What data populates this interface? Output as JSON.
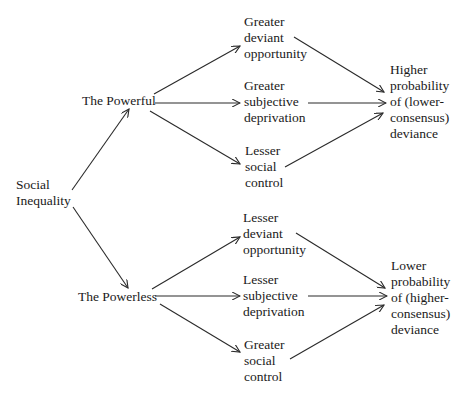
{
  "diagram": {
    "type": "flow-diagram",
    "root": {
      "id": "social_inequality",
      "lines": [
        "Social",
        "Inequality"
      ]
    },
    "groups": [
      {
        "id": "powerful",
        "label": "The Powerful",
        "factors": [
          {
            "id": "p_opportunity",
            "lines": [
              "Greater",
              "deviant",
              "opportunity"
            ]
          },
          {
            "id": "p_deprivation",
            "lines": [
              "Greater",
              "subjective",
              "deprivation"
            ]
          },
          {
            "id": "p_control",
            "lines": [
              "Lesser",
              "social",
              "control"
            ]
          }
        ],
        "outcome": {
          "id": "p_outcome",
          "lines": [
            "Higher",
            "probability",
            "of (lower-",
            "consensus)",
            "deviance"
          ]
        }
      },
      {
        "id": "powerless",
        "label": "The Powerless",
        "factors": [
          {
            "id": "pl_opportunity",
            "lines": [
              "Lesser",
              "deviant",
              "opportunity"
            ]
          },
          {
            "id": "pl_deprivation",
            "lines": [
              "Lesser",
              "subjective",
              "deprivation"
            ]
          },
          {
            "id": "pl_control",
            "lines": [
              "Greater",
              "social",
              "control"
            ]
          }
        ],
        "outcome": {
          "id": "pl_outcome",
          "lines": [
            "Lower",
            "probability",
            "of (higher-",
            "consensus)",
            "deviance"
          ]
        }
      }
    ],
    "edges": [
      [
        "social_inequality",
        "powerful"
      ],
      [
        "social_inequality",
        "powerless"
      ],
      [
        "powerful",
        "p_opportunity"
      ],
      [
        "powerful",
        "p_deprivation"
      ],
      [
        "powerful",
        "p_control"
      ],
      [
        "p_opportunity",
        "p_outcome"
      ],
      [
        "p_deprivation",
        "p_outcome"
      ],
      [
        "p_control",
        "p_outcome"
      ],
      [
        "powerless",
        "pl_opportunity"
      ],
      [
        "powerless",
        "pl_deprivation"
      ],
      [
        "powerless",
        "pl_control"
      ],
      [
        "pl_opportunity",
        "pl_outcome"
      ],
      [
        "pl_deprivation",
        "pl_outcome"
      ],
      [
        "pl_control",
        "pl_outcome"
      ]
    ]
  }
}
